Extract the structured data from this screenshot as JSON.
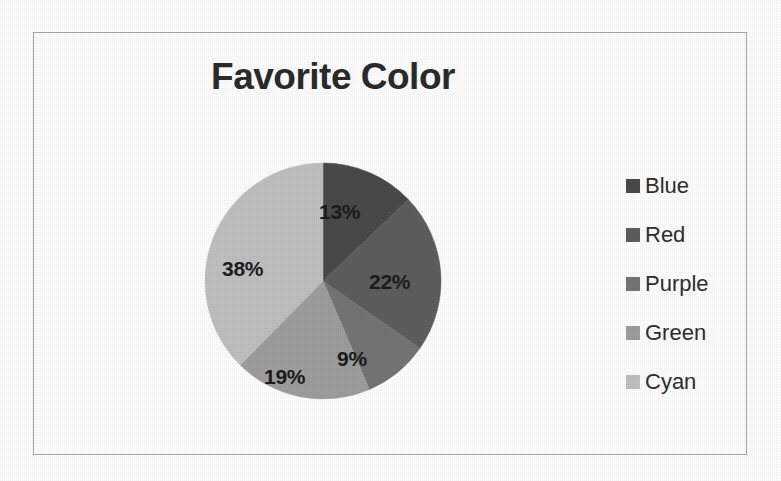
{
  "chart_data": {
    "type": "pie",
    "title": "Favorite Color",
    "categories": [
      "Blue",
      "Red",
      "Purple",
      "Green",
      "Cyan"
    ],
    "values": [
      13,
      22,
      9,
      19,
      38
    ],
    "value_labels": [
      "13%",
      "22%",
      "9%",
      "19%",
      "38%"
    ],
    "units": "percent",
    "start_angle_deg": 0,
    "direction": "clockwise",
    "legend_position": "right",
    "grid": false,
    "xlabel": "",
    "ylabel": "",
    "colors": [
      "#4a4a4a",
      "#5e5e5e",
      "#757575",
      "#9e9e9e",
      "#c0c0c0"
    ]
  },
  "title": {
    "text": "Favorite Color"
  },
  "legend": {
    "items": [
      {
        "label": "Blue",
        "color": "#4a4a4a"
      },
      {
        "label": "Red",
        "color": "#5e5e5e"
      },
      {
        "label": "Purple",
        "color": "#757575"
      },
      {
        "label": "Green",
        "color": "#9e9e9e"
      },
      {
        "label": "Cyan",
        "color": "#c0c0c0"
      }
    ]
  },
  "slice_labels": [
    {
      "text": "13%",
      "left": 115,
      "top": 38
    },
    {
      "text": "22%",
      "left": 165,
      "top": 108
    },
    {
      "text": "9%",
      "left": 133,
      "top": 185
    },
    {
      "text": "19%",
      "left": 60,
      "top": 203
    },
    {
      "text": "38%",
      "left": 18,
      "top": 95
    }
  ]
}
